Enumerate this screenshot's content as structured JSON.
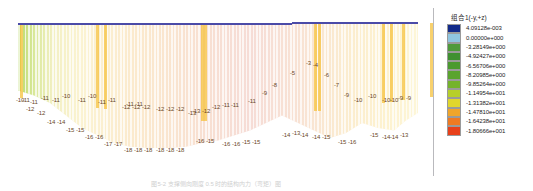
{
  "figure": {
    "caption": "图5-2   支撑侧向刚度 0.5 时的结构内力（弯矩）图"
  },
  "legend": {
    "title": "组合1(-y,+z)",
    "entries": [
      {
        "value": "4.09128e-003",
        "color": "#122a8a"
      },
      {
        "value": "0.00000e+000",
        "color": "#8fc5e0"
      },
      {
        "value": "-3.28149e+000",
        "color": "#4f9a3a"
      },
      {
        "value": "-4.92427e+000",
        "color": "#3f9030"
      },
      {
        "value": "-6.56706e+000",
        "color": "#4b9a2f"
      },
      {
        "value": "-8.20985e+000",
        "color": "#5aa42e"
      },
      {
        "value": "-9.85264e+000",
        "color": "#74b32c"
      },
      {
        "value": "-1.14954e+001",
        "color": "#b7cf2a"
      },
      {
        "value": "-1.31382e+001",
        "color": "#e0d62c"
      },
      {
        "value": "-1.47810e+001",
        "color": "#f0a52a"
      },
      {
        "value": "-1.64238e+001",
        "color": "#ef7a22"
      },
      {
        "value": "-1.80666e+001",
        "color": "#e8401a"
      }
    ]
  },
  "chart_data": {
    "type": "contour",
    "title": "组合1(-y,+z)",
    "xlabel": "",
    "ylabel": "",
    "grid": false,
    "legend_position": "right",
    "colorbar_levels": [
      0.00409128,
      0.0,
      -3.28149,
      -4.92427,
      -6.56706,
      -8.20985,
      -9.85264,
      -11.4954,
      -13.1382,
      -14.781,
      -16.4238,
      -18.0666
    ],
    "colorbar_labels": [
      "4.09128e-003",
      "0.00000e+000",
      "-3.28149e+000",
      "-4.92427e+000",
      "-6.56706e+000",
      "-8.20985e+000",
      "-9.85264e+000",
      "-1.14954e+001",
      "-1.31382e+001",
      "-1.47810e+001",
      "-1.64238e+001",
      "-1.80666e+001"
    ],
    "value_range": [
      -18.0666,
      0.00409128
    ],
    "node_labels": [
      {
        "text": "-10",
        "x": 16,
        "y": 97
      },
      {
        "text": "-11",
        "x": 22,
        "y": 97
      },
      {
        "text": "-11",
        "x": 30,
        "y": 99
      },
      {
        "text": "-11",
        "x": 41,
        "y": 95
      },
      {
        "text": "-11",
        "x": 52,
        "y": 97
      },
      {
        "text": "-10",
        "x": 62,
        "y": 93
      },
      {
        "text": "-11",
        "x": 78,
        "y": 97
      },
      {
        "text": "-10",
        "x": 88,
        "y": 93
      },
      {
        "text": "-11",
        "x": 98,
        "y": 99
      },
      {
        "text": "-11",
        "x": 108,
        "y": 97
      },
      {
        "text": "-11",
        "x": 126,
        "y": 101
      },
      {
        "text": "-11",
        "x": 135,
        "y": 101
      },
      {
        "text": "-12",
        "x": 26,
        "y": 106
      },
      {
        "text": "-12",
        "x": 37,
        "y": 110
      },
      {
        "text": "-14",
        "x": 47,
        "y": 119
      },
      {
        "text": "-14",
        "x": 57,
        "y": 119
      },
      {
        "text": "-15",
        "x": 66,
        "y": 127
      },
      {
        "text": "-15",
        "x": 76,
        "y": 127
      },
      {
        "text": "-16",
        "x": 85,
        "y": 134
      },
      {
        "text": "-16",
        "x": 95,
        "y": 134
      },
      {
        "text": "-17",
        "x": 104,
        "y": 141
      },
      {
        "text": "-17",
        "x": 114,
        "y": 141
      },
      {
        "text": "-18",
        "x": 124,
        "y": 147
      },
      {
        "text": "-18",
        "x": 134,
        "y": 147
      },
      {
        "text": "-18",
        "x": 144,
        "y": 147
      },
      {
        "text": "-18",
        "x": 156,
        "y": 147
      },
      {
        "text": "-18",
        "x": 166,
        "y": 147
      },
      {
        "text": "-18",
        "x": 176,
        "y": 147
      },
      {
        "text": "-12",
        "x": 122,
        "y": 104
      },
      {
        "text": "-12",
        "x": 132,
        "y": 104
      },
      {
        "text": "-12",
        "x": 142,
        "y": 104
      },
      {
        "text": "-12",
        "x": 156,
        "y": 106
      },
      {
        "text": "-12",
        "x": 166,
        "y": 106
      },
      {
        "text": "-12",
        "x": 176,
        "y": 106
      },
      {
        "text": "-13",
        "x": 188,
        "y": 110
      },
      {
        "text": "-13",
        "x": 192,
        "y": 108
      },
      {
        "text": "-12",
        "x": 202,
        "y": 108
      },
      {
        "text": "-12",
        "x": 212,
        "y": 104
      },
      {
        "text": "-11",
        "x": 222,
        "y": 102
      },
      {
        "text": "-11",
        "x": 231,
        "y": 102
      },
      {
        "text": "-11",
        "x": 248,
        "y": 98
      },
      {
        "text": "-9",
        "x": 262,
        "y": 90
      },
      {
        "text": "-8",
        "x": 272,
        "y": 82
      },
      {
        "text": "-5",
        "x": 290,
        "y": 70
      },
      {
        "text": "-3",
        "x": 306,
        "y": 60
      },
      {
        "text": "-4",
        "x": 313,
        "y": 62
      },
      {
        "text": "-6",
        "x": 324,
        "y": 72
      },
      {
        "text": "-7",
        "x": 334,
        "y": 82
      },
      {
        "text": "-9",
        "x": 344,
        "y": 92
      },
      {
        "text": "-10",
        "x": 354,
        "y": 97
      },
      {
        "text": "-10",
        "x": 368,
        "y": 93
      },
      {
        "text": "-10",
        "x": 382,
        "y": 97
      },
      {
        "text": "-10",
        "x": 390,
        "y": 97
      },
      {
        "text": "-9",
        "x": 398,
        "y": 95
      },
      {
        "text": "-9",
        "x": 406,
        "y": 95
      },
      {
        "text": "-16",
        "x": 196,
        "y": 138
      },
      {
        "text": "-15",
        "x": 206,
        "y": 138
      },
      {
        "text": "-16",
        "x": 222,
        "y": 141
      },
      {
        "text": "-16",
        "x": 232,
        "y": 141
      },
      {
        "text": "-15",
        "x": 242,
        "y": 139
      },
      {
        "text": "-15",
        "x": 252,
        "y": 139
      },
      {
        "text": "-14",
        "x": 282,
        "y": 132
      },
      {
        "text": "-13",
        "x": 292,
        "y": 130
      },
      {
        "text": "-14",
        "x": 300,
        "y": 132
      },
      {
        "text": "-14",
        "x": 312,
        "y": 134
      },
      {
        "text": "-15",
        "x": 322,
        "y": 134
      },
      {
        "text": "-15",
        "x": 338,
        "y": 139
      },
      {
        "text": "-16",
        "x": 348,
        "y": 139
      },
      {
        "text": "-15",
        "x": 370,
        "y": 132
      },
      {
        "text": "-14",
        "x": 382,
        "y": 134
      },
      {
        "text": "-14",
        "x": 390,
        "y": 134
      },
      {
        "text": "-13",
        "x": 400,
        "y": 132
      }
    ],
    "gradient_stops": [
      {
        "pos": 0,
        "color": "#b9d96a"
      },
      {
        "pos": 4,
        "color": "#d9e89a"
      },
      {
        "pos": 9,
        "color": "#f3f0c4"
      },
      {
        "pos": 16,
        "color": "#fbf3d2"
      },
      {
        "pos": 30,
        "color": "#fbe9cd"
      },
      {
        "pos": 46,
        "color": "#f8e0d2"
      },
      {
        "pos": 58,
        "color": "#f6dcd6"
      },
      {
        "pos": 70,
        "color": "#f8e2d4"
      },
      {
        "pos": 82,
        "color": "#fbeccf"
      },
      {
        "pos": 92,
        "color": "#fdf2cf"
      },
      {
        "pos": 100,
        "color": "#fdf6d8"
      }
    ],
    "hot_columns": [
      2,
      78,
      86,
      183,
      186,
      296,
      300,
      364,
      372,
      384,
      412
    ]
  }
}
